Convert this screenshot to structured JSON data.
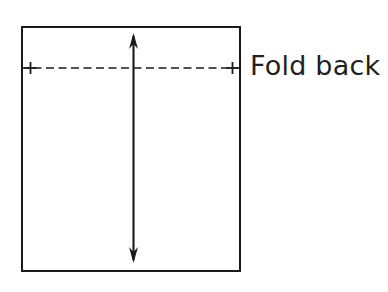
{
  "figure": {
    "background_color": "#ffffff",
    "ink_color": "#1a1a1a",
    "width": 388,
    "height": 292
  },
  "labels": {
    "fold_back": "Fold back"
  },
  "shapes": {
    "panel": {
      "name": "fabric-panel-rectangle",
      "x": 21,
      "y": 26,
      "width": 220,
      "height": 246,
      "stroke_color": "#1a1a1a",
      "stroke_width": 2,
      "fill": "none"
    },
    "fold_line": {
      "name": "fold-line-dashed",
      "x1": 21,
      "y1": 68,
      "x2": 241,
      "y2": 68,
      "stroke_color": "#1a1a1a",
      "stroke_width": 1.6,
      "dash": "8 4.5"
    },
    "marker_left": {
      "name": "plus-marker-left",
      "cx": 30,
      "cy": 68,
      "arm": 6,
      "stroke_width": 1.6
    },
    "marker_right": {
      "name": "plus-marker-right",
      "cx": 232,
      "cy": 68,
      "arm": 6,
      "stroke_width": 1.6
    },
    "measure_arrow": {
      "name": "vertical-double-arrow",
      "x": 133,
      "y_top": 33,
      "y_bottom": 263,
      "stroke_width": 2,
      "head_width": 9,
      "head_length": 16
    }
  },
  "label_position": {
    "fold_back": {
      "left": 250,
      "top": 50,
      "font_size": 27
    }
  }
}
